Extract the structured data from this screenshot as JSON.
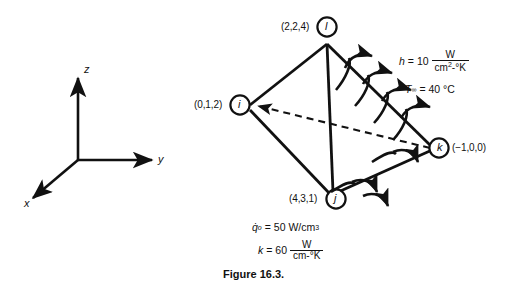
{
  "figure": {
    "caption": "Figure 16.3.",
    "background_color": "#ffffff",
    "ink_color": "#111111"
  },
  "axes": {
    "label_z": "z",
    "label_y": "y",
    "label_x": "x"
  },
  "tetrahedron": {
    "nodes": [
      {
        "id": "l",
        "letter": "l",
        "coords": "(2,2,4)"
      },
      {
        "id": "i",
        "letter": "i",
        "coords": "(0,1,2)"
      },
      {
        "id": "j",
        "letter": "j",
        "coords": "(4,3,1)"
      },
      {
        "id": "k",
        "letter": "k",
        "coords": "(−1,0,0)"
      }
    ]
  },
  "convection": {
    "h_symbol": "h",
    "h_equals": "= 10",
    "h_numerator": "W",
    "h_denominator_main": "cm",
    "h_denominator_exp": "2",
    "h_denominator_tail": "-°K",
    "tinf_symbol": "T",
    "tinf_subscript": "∞",
    "tinf_value": "= 40 °C"
  },
  "properties": {
    "q_symbol": "q̇",
    "q_subscript": "o",
    "q_value": "= 50 W/cm",
    "q_exp": "3",
    "k_symbol": "k",
    "k_equals": "= 60",
    "k_numerator": "W",
    "k_denominator": "cm-°K"
  }
}
